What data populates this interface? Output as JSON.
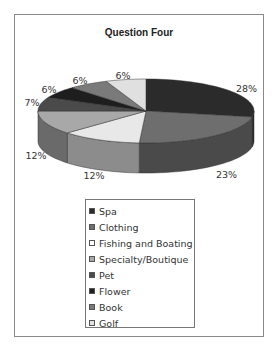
{
  "chart_data": {
    "type": "pie",
    "title": "Question Four",
    "style": "3d",
    "categories": [
      "Spa",
      "Clothing",
      "Fishing and Boating",
      "Specialty/Boutique",
      "Pet",
      "Flower",
      "Book",
      "Golf"
    ],
    "values": [
      28,
      23,
      12,
      12,
      7,
      6,
      6,
      6
    ],
    "labels": [
      "28%",
      "23%",
      "12%",
      "12%",
      "7%",
      "6%",
      "6%",
      "6%"
    ],
    "colors": [
      "#2b2b2b",
      "#6e6e6e",
      "#e8e8e8",
      "#a8a8a8",
      "#4a4a4a",
      "#1e1e1e",
      "#7a7a7a",
      "#e0e0e0"
    ],
    "side_colors": [
      "#262626",
      "#4a4a4a",
      "#8c8c8c",
      "#6a6a6a",
      "#3a3a3a",
      "#181818",
      "#5a5a5a",
      "#9a9a9a"
    ],
    "legend_position": "bottom"
  },
  "legend": {
    "items": [
      {
        "label": "Spa",
        "color": "#2b2b2b"
      },
      {
        "label": "Clothing",
        "color": "#6e6e6e"
      },
      {
        "label": "Fishing and Boating",
        "color": "#ffffff"
      },
      {
        "label": "Specialty/Boutique",
        "color": "#a8a8a8"
      },
      {
        "label": "Pet",
        "color": "#4a4a4a"
      },
      {
        "label": "Flower",
        "color": "#1e1e1e"
      },
      {
        "label": "Book",
        "color": "#7a7a7a"
      },
      {
        "label": "Golf",
        "color": "#e0e0e0"
      }
    ]
  }
}
